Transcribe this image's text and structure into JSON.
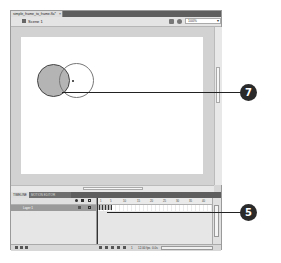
{
  "window": {
    "document_tab": "simple_frame_to_frame.fla*",
    "document_tab_close": "×"
  },
  "edit_bar": {
    "scene_label": "Scene 1",
    "zoom_value": "100%",
    "zoom_arrow": "▾"
  },
  "panels": {
    "tabs": [
      {
        "label": "TIMELINE"
      },
      {
        "label": "MOTION EDITOR"
      }
    ]
  },
  "timeline": {
    "layer_name": "Layer 1",
    "ruler_ticks": [
      "1",
      "5",
      "10",
      "15",
      "20",
      "25",
      "30",
      "35",
      "40"
    ],
    "footer": {
      "current_frame": "1",
      "fps": "12.00 fps",
      "elapsed": "0.0s"
    }
  },
  "callouts": [
    {
      "number": "7"
    },
    {
      "number": "5"
    }
  ]
}
